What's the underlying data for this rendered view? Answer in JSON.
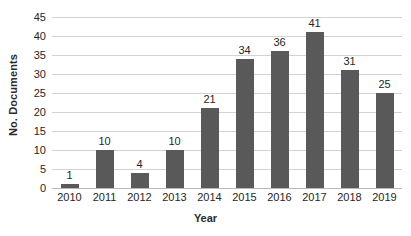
{
  "chart_data": {
    "type": "bar",
    "title": "",
    "xlabel": "Year",
    "ylabel": "No. Documents",
    "categories": [
      "2010",
      "2011",
      "2012",
      "2013",
      "2014",
      "2015",
      "2016",
      "2017",
      "2018",
      "2019"
    ],
    "values": [
      1,
      10,
      4,
      10,
      21,
      34,
      36,
      41,
      31,
      25
    ],
    "data_labels": [
      "1",
      "10",
      "4",
      "10",
      "21",
      "34",
      "36",
      "41",
      "31",
      "25"
    ],
    "ylim": [
      0,
      45
    ],
    "y_ticks": [
      "0",
      "5",
      "10",
      "15",
      "20",
      "25",
      "30",
      "35",
      "40",
      "45"
    ],
    "y_tick_values": [
      0,
      5,
      10,
      15,
      20,
      25,
      30,
      35,
      40,
      45
    ],
    "grid": "horizontal",
    "legend": "none",
    "bar_color": "#595959",
    "gridline_color": "#d2d2d2",
    "text_color": "#262626",
    "background_color": "#ffffff"
  }
}
